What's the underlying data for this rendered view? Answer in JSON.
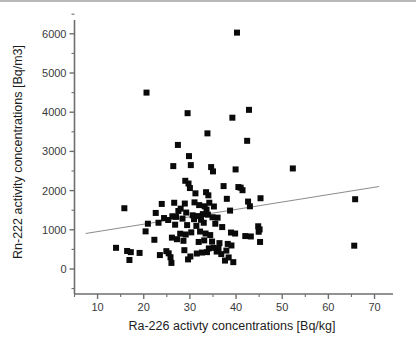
{
  "chart_data": {
    "type": "scatter",
    "title": "",
    "xlabel": "Ra-226 activty concentrations [Bq/kg]",
    "ylabel": "Rn-222 activity concentrations [Bq/m3]",
    "xlim": [
      5,
      74
    ],
    "ylim": [
      -350,
      6400
    ],
    "xticks": [
      10,
      20,
      30,
      40,
      50,
      60,
      70
    ],
    "xtick_labels": [
      "10",
      "20",
      "30",
      "40",
      "50",
      "60",
      "70"
    ],
    "yticks": [
      0,
      1000,
      2000,
      3000,
      4000,
      5000,
      6000
    ],
    "ytick_labels": [
      "0",
      "1000",
      "2000",
      "3000",
      "4000",
      "5000",
      "6000"
    ],
    "grid": false,
    "legend": null,
    "marker": {
      "shape": "square",
      "color": "#0a0a0a",
      "size_px": 6
    },
    "series": [
      {
        "name": "Rn-222 vs Ra-226",
        "marker_color": "#0a0a0a",
        "points": [
          [
            40.2,
            6030
          ],
          [
            20.6,
            4500
          ],
          [
            42.8,
            4060
          ],
          [
            29.5,
            3975
          ],
          [
            39.2,
            3860
          ],
          [
            42.4,
            3270
          ],
          [
            33.8,
            3460
          ],
          [
            27.4,
            3165
          ],
          [
            29.8,
            2880
          ],
          [
            26.4,
            2625
          ],
          [
            30.2,
            2650
          ],
          [
            34.6,
            2600
          ],
          [
            35.0,
            2490
          ],
          [
            39.9,
            2540
          ],
          [
            52.3,
            2565
          ],
          [
            29.0,
            2250
          ],
          [
            29.7,
            2180
          ],
          [
            30.0,
            2065
          ],
          [
            37.3,
            2115
          ],
          [
            40.5,
            2090
          ],
          [
            41.0,
            2075
          ],
          [
            41.4,
            2010
          ],
          [
            31.2,
            1930
          ],
          [
            33.5,
            1960
          ],
          [
            34.0,
            1880
          ],
          [
            38.0,
            1790
          ],
          [
            45.3,
            1805
          ],
          [
            65.8,
            1780
          ],
          [
            42.6,
            1720
          ],
          [
            31.0,
            1700
          ],
          [
            26.6,
            1690
          ],
          [
            28.9,
            1670
          ],
          [
            23.9,
            1660
          ],
          [
            32.0,
            1630
          ],
          [
            33.2,
            1600
          ],
          [
            34.2,
            1690
          ],
          [
            35.2,
            1595
          ],
          [
            15.8,
            1550
          ],
          [
            28.0,
            1540
          ],
          [
            33.6,
            1515
          ],
          [
            38.7,
            1490
          ],
          [
            27.5,
            1480
          ],
          [
            29.2,
            1440
          ],
          [
            22.6,
            1430
          ],
          [
            32.8,
            1400
          ],
          [
            33.9,
            1385
          ],
          [
            30.6,
            1370
          ],
          [
            31.7,
            1350
          ],
          [
            26.2,
            1345
          ],
          [
            27.0,
            1330
          ],
          [
            34.9,
            1320
          ],
          [
            36.0,
            1310
          ],
          [
            24.4,
            1300
          ],
          [
            28.4,
            1285
          ],
          [
            30.9,
            1270
          ],
          [
            32.4,
            1255
          ],
          [
            25.3,
            1250
          ],
          [
            43.0,
            1600
          ],
          [
            44.8,
            1090
          ],
          [
            44.9,
            950
          ],
          [
            45.1,
            1010
          ],
          [
            20.9,
            1155
          ],
          [
            23.2,
            1180
          ],
          [
            26.8,
            1130
          ],
          [
            29.4,
            1120
          ],
          [
            31.4,
            1100
          ],
          [
            33.0,
            1180
          ],
          [
            35.5,
            1155
          ],
          [
            37.0,
            1070
          ],
          [
            20.4,
            960
          ],
          [
            27.9,
            900
          ],
          [
            29.1,
            880
          ],
          [
            30.3,
            935
          ],
          [
            32.2,
            955
          ],
          [
            33.4,
            905
          ],
          [
            34.4,
            865
          ],
          [
            38.9,
            930
          ],
          [
            39.8,
            905
          ],
          [
            42.0,
            840
          ],
          [
            43.2,
            830
          ],
          [
            22.3,
            745
          ],
          [
            26.1,
            800
          ],
          [
            27.2,
            760
          ],
          [
            28.6,
            720
          ],
          [
            31.9,
            690
          ],
          [
            33.1,
            730
          ],
          [
            34.8,
            700
          ],
          [
            36.4,
            660
          ],
          [
            38.2,
            640
          ],
          [
            39.0,
            600
          ],
          [
            45.2,
            690
          ],
          [
            65.6,
            595
          ],
          [
            14.0,
            540
          ],
          [
            16.4,
            460
          ],
          [
            17.2,
            430
          ],
          [
            19.1,
            410
          ],
          [
            23.5,
            355
          ],
          [
            24.9,
            455
          ],
          [
            25.4,
            400
          ],
          [
            25.8,
            300
          ],
          [
            26.0,
            155
          ],
          [
            28.8,
            480
          ],
          [
            29.6,
            245
          ],
          [
            31.5,
            395
          ],
          [
            32.6,
            420
          ],
          [
            33.7,
            430
          ],
          [
            34.1,
            525
          ],
          [
            35.8,
            445
          ],
          [
            36.8,
            380
          ],
          [
            37.6,
            215
          ],
          [
            38.4,
            295
          ],
          [
            39.4,
            175
          ],
          [
            16.9,
            230
          ],
          [
            30.1,
            320
          ],
          [
            35.1,
            540
          ],
          [
            36.2,
            520
          ],
          [
            37.9,
            470
          ]
        ]
      }
    ],
    "fit_line": {
      "name": "linear-trend",
      "color": "#8e8e8e",
      "x_start": 7.4,
      "y_start": 905,
      "x_end": 71.0,
      "y_end": 2105
    }
  }
}
